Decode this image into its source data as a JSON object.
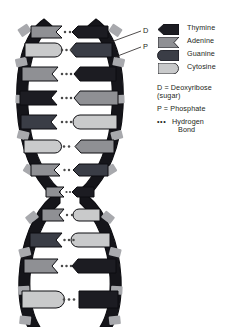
{
  "figure": {
    "background_color": "#ffffff"
  },
  "colors": {
    "thymine": "#1c1c22",
    "adenine": "#8f9094",
    "guanine": "#3a3d46",
    "cytosine": "#c9cacb",
    "backbone_phosphate": "#15151a",
    "backbone_sugar": "#a8a9ad",
    "outline": "#0d0d11",
    "text": "#231f20",
    "hbond_dot": "#3a3a3a"
  },
  "legend": {
    "swatches": [
      {
        "id": "thymine",
        "label": "Thymine",
        "shape": "arrow-left",
        "color_key": "thymine"
      },
      {
        "id": "adenine",
        "label": "Adenine",
        "shape": "notch-right",
        "color_key": "adenine"
      },
      {
        "id": "guanine",
        "label": "Guanine",
        "shape": "round-left",
        "color_key": "guanine"
      },
      {
        "id": "cytosine",
        "label": "Cytosine",
        "shape": "round-right",
        "color_key": "cytosine"
      }
    ],
    "notes": [
      {
        "id": "deoxyribose",
        "line1": "D = Deoxyribose",
        "line2": "(sugar)"
      },
      {
        "id": "phosphate",
        "line1": "P = Phosphate",
        "line2": ""
      },
      {
        "id": "hydrogen",
        "line1": "Hydrogen",
        "line2": "Bond",
        "prefix": "•••"
      }
    ]
  },
  "leaders": [
    {
      "id": "deoxyribose-leader",
      "label": "D"
    },
    {
      "id": "phosphate-leader",
      "label": "P"
    }
  ],
  "base_pairs": [
    {
      "row": 1,
      "left": "adenine",
      "right": "thymine",
      "bonds": 2
    },
    {
      "row": 2,
      "left": "cytosine",
      "right": "guanine",
      "bonds": 3
    },
    {
      "row": 3,
      "left": "adenine",
      "right": "thymine",
      "bonds": 3
    },
    {
      "row": 4,
      "left": "thymine",
      "right": "adenine",
      "bonds": 3
    },
    {
      "row": 5,
      "left": "guanine",
      "right": "cytosine",
      "bonds": 3
    },
    {
      "row": 6,
      "left": "cytosine",
      "right": "adenine",
      "bonds": 2
    },
    {
      "row": 7,
      "left": "adenine",
      "right": "guanine",
      "bonds": 2
    },
    {
      "row": 8,
      "left": "adenine",
      "right": "thymine",
      "bonds": 2
    },
    {
      "row": 9,
      "left": "guanine",
      "right": "cytosine",
      "bonds": 3
    },
    {
      "row": 10,
      "left": "adenine",
      "right": "thymine",
      "bonds": 3
    },
    {
      "row": 11,
      "left": "cytosine",
      "right": "guanine",
      "bonds": 3
    }
  ],
  "strand": {
    "turns": 2,
    "description": "two antiparallel sugar-phosphate backbones crossing at a waist"
  }
}
